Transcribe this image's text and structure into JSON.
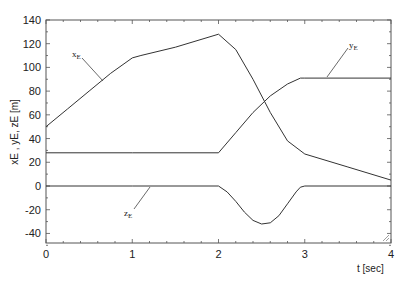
{
  "chart_data": {
    "type": "line",
    "title": "",
    "xlabel": "t [sec]",
    "ylabel": "x_E, y_E, z_E [m]",
    "xlim": [
      0,
      4
    ],
    "ylim": [
      -50,
      140
    ],
    "xticks": [
      0,
      1,
      2,
      3,
      4
    ],
    "yticks": [
      -40,
      -20,
      0,
      20,
      40,
      60,
      80,
      100,
      120,
      140
    ],
    "grid": false,
    "legend": "inline labels with leader lines",
    "series": [
      {
        "name": "x_E",
        "label": "xE",
        "x": [
          0,
          0.25,
          0.5,
          0.75,
          1.0,
          1.1,
          1.5,
          2.0,
          2.2,
          2.4,
          2.6,
          2.8,
          3.0,
          3.5,
          4.0
        ],
        "y": [
          50,
          65,
          80,
          95,
          108,
          110,
          117,
          128,
          115,
          90,
          62,
          38,
          27,
          16,
          5
        ]
      },
      {
        "name": "y_E",
        "label": "yE",
        "x": [
          0,
          1,
          2.0,
          2.2,
          2.4,
          2.6,
          2.8,
          2.95,
          3.0,
          4.0
        ],
        "y": [
          28,
          28,
          28,
          45,
          62,
          76,
          86,
          91,
          91,
          91
        ]
      },
      {
        "name": "z_E",
        "label": "zE",
        "x": [
          0,
          1,
          2.0,
          2.1,
          2.2,
          2.3,
          2.4,
          2.5,
          2.6,
          2.7,
          2.8,
          2.9,
          2.95,
          3.0,
          4.0
        ],
        "y": [
          0,
          0,
          0,
          -5,
          -13,
          -22,
          -29,
          -32,
          -31,
          -25,
          -15,
          -5,
          -1,
          0,
          0
        ]
      }
    ]
  },
  "axes": {
    "x_tick_labels": [
      "0",
      "1",
      "2",
      "3",
      "4"
    ],
    "y_tick_labels": [
      "-40",
      "-20",
      "0",
      "20",
      "40",
      "60",
      "80",
      "100",
      "120",
      "140"
    ],
    "x_title": "t [sec]",
    "y_title": "xE , yE, zE [m]"
  },
  "labels": {
    "xE": "x",
    "yE": "y",
    "zE": "z",
    "sub": "E"
  }
}
